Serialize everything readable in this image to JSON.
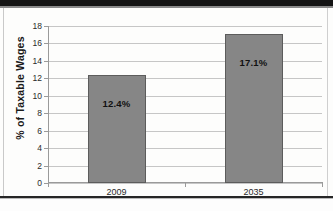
{
  "chart_data": {
    "type": "bar",
    "title": "",
    "xlabel": "",
    "ylabel": "% of Taxable Wages",
    "categories": [
      "2009",
      "2035"
    ],
    "values": [
      12.4,
      17.1
    ],
    "data_labels": [
      "12.4%",
      "17.1%"
    ],
    "ylim": [
      0,
      18
    ],
    "ytick_step": 2,
    "yticks": [
      "18",
      "16",
      "14",
      "12",
      "10",
      "8",
      "6",
      "4",
      "2",
      "0"
    ],
    "grid": true,
    "legend": "none",
    "series": [
      {
        "name": "% of Taxable Wages",
        "values": [
          12.4,
          17.1
        ],
        "color": "#868686"
      }
    ]
  },
  "style": {
    "bar_fill": "#868686",
    "bar_outline": "#5c5c5c",
    "gridline_color": "#c6c6c6",
    "axis_color": "#9a9a9a",
    "text_color": "#2b2b2b"
  }
}
